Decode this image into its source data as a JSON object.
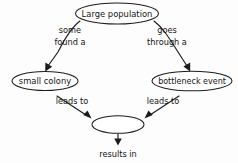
{
  "diagram": {
    "type": "concept-map",
    "background_color": "#fdfdfd",
    "stroke_color": "#1c1c1c",
    "text_color": "#141414",
    "nodes": [
      {
        "id": "large-population",
        "label": "Large population",
        "shape": "ellipse",
        "empty": false
      },
      {
        "id": "small-colony",
        "label": "small colony",
        "shape": "ellipse",
        "empty": false
      },
      {
        "id": "bottleneck-event",
        "label": "bottleneck event",
        "shape": "ellipse",
        "empty": false
      },
      {
        "id": "blank-outcome",
        "label": "",
        "shape": "ellipse",
        "empty": true
      }
    ],
    "edges": [
      {
        "id": "edge-some-found-a",
        "from": "large-population",
        "to": "small-colony",
        "label_line1": "some",
        "label_line2": "found a"
      },
      {
        "id": "edge-goes-through-a",
        "from": "large-population",
        "to": "bottleneck-event",
        "label_line1": "goes",
        "label_line2": "through a"
      },
      {
        "id": "edge-leads-to-left",
        "from": "small-colony",
        "to": "blank-outcome",
        "label_line1": "leads to",
        "label_line2": ""
      },
      {
        "id": "edge-leads-to-right",
        "from": "bottleneck-event",
        "to": "blank-outcome",
        "label_line1": "leads to",
        "label_line2": ""
      },
      {
        "id": "edge-results-in",
        "from": "blank-outcome",
        "to": "results-in-label",
        "label_line1": "results in",
        "label_line2": ""
      }
    ],
    "labels": {
      "some": "some",
      "found_a": "found a",
      "goes": "goes",
      "through_a": "through a",
      "leads_to_left": "leads to",
      "leads_to_right": "leads to",
      "results_in": "results in"
    }
  }
}
